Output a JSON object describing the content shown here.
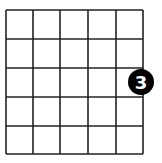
{
  "diagram": {
    "type": "go-board-fragment",
    "columns": 5,
    "rows": 5,
    "line_color": "#222222",
    "background": "#ffffff",
    "stones": [
      {
        "color": "black",
        "label": "3",
        "label_color": "#ffffff",
        "position": "right-edge, between 3rd and 4th horizontal lines"
      }
    ]
  }
}
